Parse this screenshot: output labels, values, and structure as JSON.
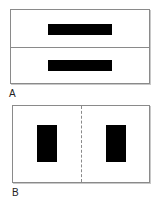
{
  "figure": {
    "panels": [
      {
        "id": "A",
        "label": "A",
        "description": "Rectangle split horizontally into two halves, each containing a horizontal black bar",
        "divider": "solid-horizontal",
        "bars": [
          {
            "orientation": "horizontal",
            "position": "top-half"
          },
          {
            "orientation": "horizontal",
            "position": "bottom-half"
          }
        ]
      },
      {
        "id": "B",
        "label": "B",
        "description": "Rectangle split vertically by a dashed line, each half containing a vertical black bar",
        "divider": "dashed-vertical",
        "bars": [
          {
            "orientation": "vertical",
            "position": "left-half"
          },
          {
            "orientation": "vertical",
            "position": "right-half"
          }
        ]
      }
    ],
    "colors": {
      "bar": "#000000",
      "border": "#8a8a8a",
      "background": "#ffffff"
    }
  }
}
